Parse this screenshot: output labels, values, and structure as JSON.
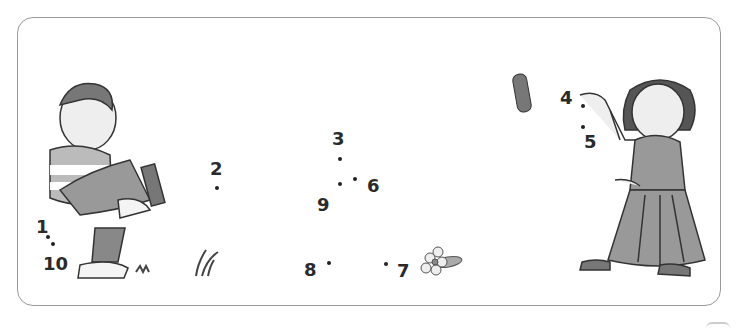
{
  "worksheet": {
    "type": "connect-the-dots",
    "points": [
      {
        "label": "1",
        "x": 36,
        "y": 218
      },
      {
        "label": "2",
        "x": 210,
        "y": 160
      },
      {
        "label": "3",
        "x": 332,
        "y": 130
      },
      {
        "label": "4",
        "x": 560,
        "y": 89
      },
      {
        "label": "5",
        "x": 584,
        "y": 133
      },
      {
        "label": "6",
        "x": 367,
        "y": 177
      },
      {
        "label": "7",
        "x": 397,
        "y": 262
      },
      {
        "label": "8",
        "x": 304,
        "y": 261
      },
      {
        "label": "9",
        "x": 317,
        "y": 196
      },
      {
        "label": "10",
        "x": 43,
        "y": 255
      }
    ],
    "dots": [
      {
        "x": 215,
        "y": 186
      },
      {
        "x": 338,
        "y": 157
      },
      {
        "x": 338,
        "y": 182
      },
      {
        "x": 353,
        "y": 177
      },
      {
        "x": 327,
        "y": 261
      },
      {
        "x": 384,
        "y": 262
      },
      {
        "x": 581,
        "y": 125
      },
      {
        "x": 46,
        "y": 235
      },
      {
        "x": 51,
        "y": 242
      }
    ],
    "figures": [
      "boy-sitting",
      "girl-throwing",
      "stone",
      "flower",
      "grass"
    ]
  }
}
